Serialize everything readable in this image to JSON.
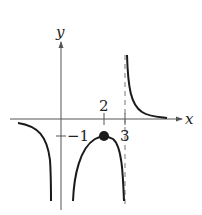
{
  "graph": {
    "axes": {
      "x_label": "x",
      "y_label": "y"
    },
    "tick_labels": {
      "x_two": "2",
      "x_three": "3",
      "y_neg_one": "−1"
    },
    "asymptote": {
      "x": 3,
      "style": "dashed"
    },
    "marked_point": {
      "x": 2,
      "y": -1
    },
    "colors": {
      "curve": "#1a1a1a",
      "axis": "#555555",
      "asymptote": "#777777"
    }
  }
}
